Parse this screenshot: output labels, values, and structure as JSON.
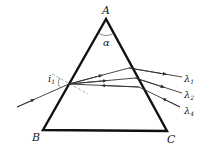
{
  "diagram": {
    "vertices": {
      "apex": "A",
      "bottom_left": "B",
      "bottom_right": "C"
    },
    "apex_angle_label": "α",
    "incidence_angle_label": "i",
    "incidence_angle_subscript": "1",
    "rays": [
      {
        "label": "λ",
        "subscript": "1"
      },
      {
        "label": "λ",
        "subscript": "2"
      },
      {
        "label": "λ",
        "subscript": "4"
      }
    ],
    "colors": {
      "prism": "#111111",
      "ray": "#333333",
      "normal": "#888888",
      "background": "#ffffff"
    }
  }
}
